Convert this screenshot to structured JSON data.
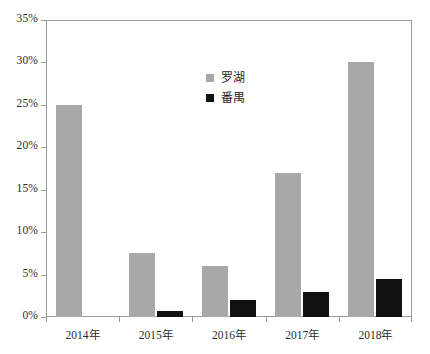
{
  "chart_data": {
    "type": "bar",
    "title": "",
    "subtitle": "",
    "xlabel": "",
    "ylabel": "",
    "categories": [
      "2014年",
      "2015年",
      "2016年",
      "2017年",
      "2018年"
    ],
    "series": [
      {
        "name": "罗湖",
        "color": "#a8a8a8",
        "values": [
          25,
          7.5,
          6,
          17,
          30
        ]
      },
      {
        "name": "番禺",
        "color": "#111111",
        "values": [
          0,
          0.7,
          2,
          3,
          4.5
        ]
      }
    ],
    "ylim": [
      0,
      35
    ],
    "ytick_values": [
      0,
      5,
      10,
      15,
      20,
      25,
      30,
      35
    ],
    "ytick_labels": [
      "0%",
      "5%",
      "10%",
      "15%",
      "20%",
      "25%",
      "30%",
      "35%"
    ],
    "grid": false,
    "legend_position": "upper-center-inside",
    "axis_color": "#9a9a9a",
    "background_color": "#ffffff",
    "value_suffix": "%"
  }
}
